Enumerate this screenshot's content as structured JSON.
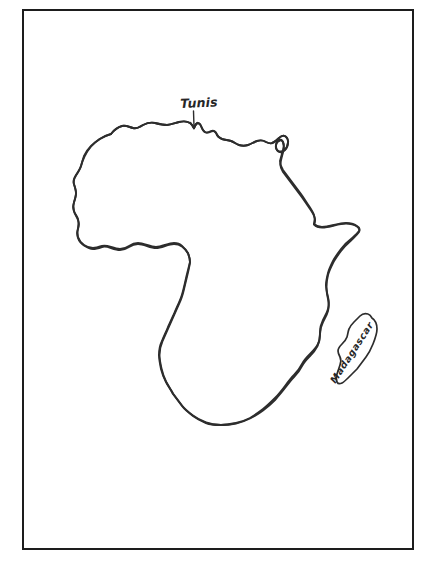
{
  "figure": {
    "type": "hand-drawn-outline-map",
    "background_color": "#ffffff",
    "ink_color": "#2a2a2a",
    "frame_color": "#1d1d1d"
  },
  "frame": {
    "label": "map-border",
    "x": 22,
    "y": 9,
    "width": 392,
    "height": 541,
    "stroke_width": 2.2
  },
  "labels": {
    "tunis": {
      "text": "Tunis",
      "x": 180,
      "y": 96,
      "rotation_deg": -2.5,
      "has_leader_arrow": true,
      "arrow_points_to": "north-tunisian-coast"
    },
    "madagascar": {
      "text": "Madagascar",
      "x": 337,
      "y": 374,
      "rotation_deg": -57,
      "has_leader_arrow": false,
      "placement": "inside-island"
    }
  },
  "shapes": {
    "africa_mainland": {
      "name": "africa-mainland-outline",
      "closed": true,
      "path": "M 200 123 C 196 121, 191 121, 187 123 C 182 126, 177 126, 172 124 C 166 122, 160 122, 155 125 C 150 128, 144 129, 139 127 C 134 125, 129 126, 125 129 C 120 133, 115 134, 110 132 C 105 130, 100 133, 98 138 C 96 143, 93 147, 89 149 C 85 151, 82 155, 81 160 C 80 165, 78 169, 75 172 C 72 176, 71 181, 72 186 C 73 191, 72 196, 69 199 C 66 203, 65 208, 66 213 C 67 218, 66 223, 64 227 C 62 231, 62 236, 64 240 C 66 244, 66 249, 65 253 C 64 258, 65 263, 68 266 C 71 270, 73 275, 73 280 C 73 285, 75 290, 79 293 C 83 297, 86 302, 88 307 C 90 312, 93 316, 97 319 C 101 322, 105 325, 109 327 C 114 330, 119 331, 124 331 C 130 331, 135 330, 140 328 C 146 326, 151 325, 157 325 C 163 325, 169 325, 175 327 C 181 329, 187 329, 192 327 C 197 325, 202 324, 207 325 C 212 326, 217 325, 221 322 C 225 319, 230 318, 234 319 C 238 320, 242 323, 244 327 C 246 331, 248 336, 249 341 C 250 346, 252 350, 255 354 C 258 358, 260 363, 261 368 C 262 374, 263 379, 265 384 C 267 389, 268 394, 267 399 C 266 405, 264 410, 261 414 C 258 418, 254 421, 250 423 C 245 425, 241 426, 236 426 C 231 426, 226 426, 222 425 C 217 424, 213 422, 209 420 C 204 417, 200 414, 196 411 C 192 407, 188 404, 185 400 C 181 396, 178 392, 175 387 C 172 382, 169 377, 167 372 C 164 366, 162 361, 160 355 C 158 349, 196 123, 200 123 Z"
    },
    "madagascar_island": {
      "name": "madagascar-island-outline",
      "closed": true
    }
  },
  "annotations": {
    "tunis_arrow": {
      "name": "tunis-leader-arrow",
      "from_x": 193,
      "from_y": 111,
      "to_x": 194,
      "to_y": 128
    }
  }
}
